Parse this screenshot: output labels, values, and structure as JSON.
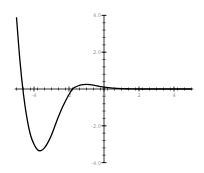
{
  "chart_data": {
    "type": "line",
    "title": "",
    "xlabel": "",
    "ylabel": "",
    "xlim": [
      -5.1,
      5.1
    ],
    "ylim": [
      -4.0,
      4.0
    ],
    "grid": false,
    "legend": null,
    "x_ticks": [
      -4,
      -2,
      0,
      2,
      4
    ],
    "x_tick_labels": [
      "-4",
      "-2",
      "0",
      "2",
      "4"
    ],
    "y_ticks": [
      4.0,
      2.0,
      -2.0,
      -4.0
    ],
    "y_tick_labels": [
      "4.0",
      "2.0",
      "-2.0",
      "-4.0"
    ],
    "series": [
      {
        "name": "f(x)",
        "color": "#000000",
        "x": [
          -5.0,
          -4.8,
          -4.6,
          -4.4,
          -4.2,
          -4.0,
          -3.8,
          -3.6,
          -3.4,
          -3.2,
          -3.0,
          -2.8,
          -2.6,
          -2.4,
          -2.2,
          -2.0,
          -1.8,
          -1.6,
          -1.4,
          -1.2,
          -1.0,
          -0.8,
          -0.6,
          -0.4,
          -0.2,
          0.0,
          0.5,
          1.0,
          1.5,
          2.0,
          3.0,
          4.0,
          5.0
        ],
        "values": [
          3.9,
          1.5,
          -0.3,
          -1.6,
          -2.5,
          -3.0,
          -3.3,
          -3.35,
          -3.2,
          -2.9,
          -2.5,
          -2.0,
          -1.5,
          -1.05,
          -0.65,
          -0.3,
          0.0,
          0.12,
          0.2,
          0.24,
          0.25,
          0.24,
          0.21,
          0.17,
          0.13,
          0.1,
          0.05,
          0.02,
          0.01,
          0.0,
          0.0,
          0.0,
          0.0
        ]
      }
    ]
  },
  "axes": {
    "x_origin_px": 104,
    "y_origin_px": 89,
    "px_per_x_unit": 17.5,
    "px_per_y_unit": 18.4,
    "axis_color": "#000000",
    "label_color": "#9a9a9a"
  }
}
